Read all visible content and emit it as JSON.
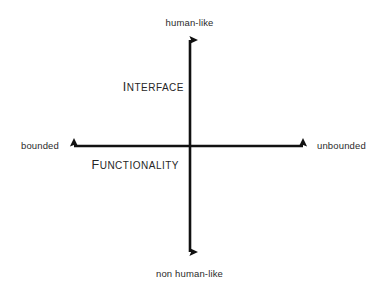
{
  "diagram": {
    "type": "two-axis-quadrant",
    "background_color": "#ffffff",
    "axis_color": "#111111",
    "text_color": "#2b2b2b",
    "vertical_axis": {
      "top_label": "human-like",
      "bottom_label": "non human-like",
      "interior_label_initial": "I",
      "interior_label_rest": "NTERFACE",
      "interior_label_full": "INTERFACE"
    },
    "horizontal_axis": {
      "left_label": "bounded",
      "right_label": "unbounded",
      "interior_label_initial": "F",
      "interior_label_rest": "UNCTIONALITY",
      "interior_label_full": "FUNCTIONALITY"
    }
  }
}
